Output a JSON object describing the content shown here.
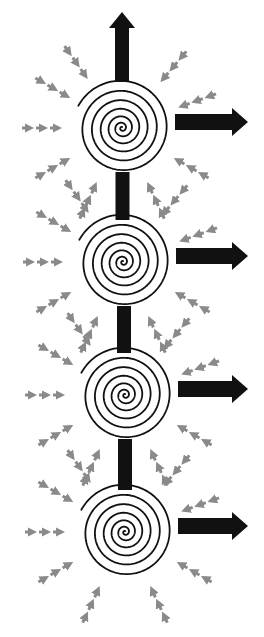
{
  "diagram": {
    "title": "",
    "colors": {
      "background": "#ffffff",
      "spiral_stroke": "#111111",
      "outflow_arrow": "#111111",
      "inflow_arrow": "#8a8a8a"
    },
    "vortices": [
      {
        "id": "vortex-1",
        "cx": 122,
        "cy": 128,
        "outer_r": 48
      },
      {
        "id": "vortex-2",
        "cx": 123,
        "cy": 262,
        "outer_r": 48
      },
      {
        "id": "vortex-3",
        "cx": 125,
        "cy": 395,
        "outer_r": 48
      },
      {
        "id": "vortex-4",
        "cx": 125,
        "cy": 532,
        "outer_r": 48
      }
    ],
    "outflow_arrows": [
      {
        "id": "top-outflow",
        "direction": "up",
        "from_vortex": "vortex-1"
      },
      {
        "id": "right-outflow-1",
        "direction": "right",
        "from_vortex": "vortex-1"
      },
      {
        "id": "right-outflow-2",
        "direction": "right",
        "from_vortex": "vortex-2"
      },
      {
        "id": "right-outflow-3",
        "direction": "right",
        "from_vortex": "vortex-3"
      },
      {
        "id": "right-outflow-4",
        "direction": "right",
        "from_vortex": "vortex-4"
      }
    ],
    "connectors": [
      {
        "id": "connector-1-2",
        "between": [
          "vortex-1",
          "vortex-2"
        ]
      },
      {
        "id": "connector-2-3",
        "between": [
          "vortex-2",
          "vortex-3"
        ]
      },
      {
        "id": "connector-3-4",
        "between": [
          "vortex-3",
          "vortex-4"
        ]
      }
    ],
    "inflow_arrow_count_per_vortex": 9,
    "labels": []
  }
}
